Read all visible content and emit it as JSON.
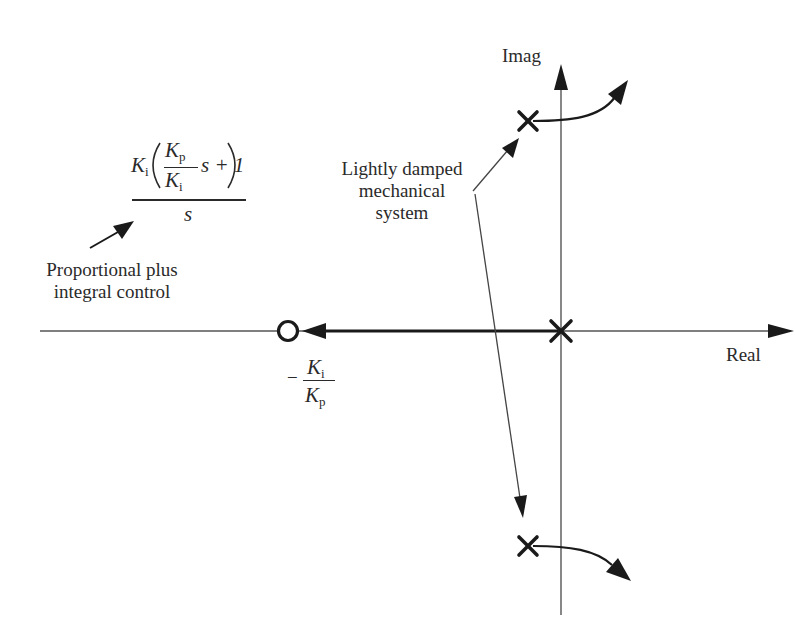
{
  "diagram": {
    "type": "root-locus",
    "axes": {
      "real_label": "Real",
      "imag_label": "Imag"
    },
    "transfer_function": {
      "numerator_gain": "K",
      "numerator_gain_sub": "i",
      "inner_num": "K",
      "inner_num_sub": "p",
      "inner_den": "K",
      "inner_den_sub": "i",
      "inner_tail": "s + 1",
      "denominator": "s",
      "caption_line1": "Proportional plus",
      "caption_line2": "integral control"
    },
    "zero_label": {
      "sign": "−",
      "num": "K",
      "num_sub": "i",
      "den": "K",
      "den_sub": "p"
    },
    "annotation": {
      "line1": "Lightly damped",
      "line2": "mechanical",
      "line3": "system"
    },
    "markers": {
      "poles": [
        {
          "name": "origin-pole",
          "symbol": "×"
        },
        {
          "name": "upper-complex-pole",
          "symbol": "×"
        },
        {
          "name": "lower-complex-pole",
          "symbol": "×"
        }
      ],
      "zeros": [
        {
          "name": "pi-zero",
          "symbol": "○"
        }
      ]
    },
    "colors": {
      "ink": "#2a2a2a",
      "background": "#ffffff"
    }
  }
}
